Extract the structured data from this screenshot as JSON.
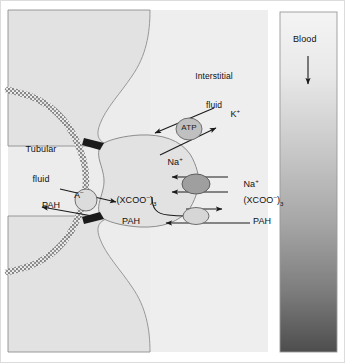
{
  "figure": {
    "background_color": "#ffffff",
    "border_color": "#d8d8d8",
    "width": 345,
    "height": 363
  },
  "compartments": {
    "tubular_fluid": {
      "label_line1": "Tubular",
      "label_line2": "fluid",
      "fill_color": "#ececec"
    },
    "interstitial_fluid": {
      "label_line1": "Interstitial",
      "label_line2": "fluid",
      "fill_color": "#eeeeee"
    },
    "blood": {
      "label": "Blood",
      "flow_arrow": "down-arrow-icon",
      "gradient_top_color": "#f2f2f2",
      "gradient_bottom_color": "#4f4f4f",
      "border_color": "#9a9a9a"
    },
    "cell": {
      "fill_color": "#e2e2e2",
      "outline_color": "#8c8c8c",
      "brush_border_color": "#8e8e8e",
      "tight_junction_color": "#1b1b1b"
    }
  },
  "transporters": {
    "apical_exchanger": {
      "name": "apical-anion-exchanger",
      "fill_color": "#dcdcdc",
      "stroke_color": "#6f6f6f"
    },
    "atp_pump": {
      "name": "sodium-potassium-atpase",
      "label": "ATP",
      "fill_color": "#c0c0c0",
      "stroke_color": "#6f6f6f"
    },
    "sodium_dicarboxylate": {
      "name": "sodium-dicarboxylate-cotransporter",
      "fill_color": "#9f9f9f",
      "stroke_color": "#5e5e5e"
    },
    "basolateral_exchanger": {
      "name": "basolateral-oat-exchanger",
      "fill_color": "#d6d6d6",
      "stroke_color": "#6f6f6f"
    }
  },
  "labels": {
    "potassium": "K",
    "potassium_charge": "+",
    "sodium_pump": "Na",
    "sodium_pump_charge": "+",
    "sodium_cotransport": "Na",
    "sodium_cotransport_charge": "+",
    "dicarboxylate_in_open": "(XCOO",
    "dicarboxylate_in_charge": "–",
    "dicarboxylate_in_close": ")",
    "dicarboxylate_in_sub": "3",
    "dicarboxylate_out_open": "(XCOO",
    "dicarboxylate_out_charge": "–",
    "dicarboxylate_out_close": ")",
    "dicarboxylate_out_sub": "3",
    "anion": "A",
    "anion_charge": "–",
    "pah_tubular": "PAH",
    "pah_cell": "PAH",
    "pah_blood": "PAH",
    "atp": "ATP"
  },
  "arrows": {
    "stroke_color": "#1a1a1a",
    "items": [
      {
        "name": "potassium-influx-arrow",
        "direction": "into-cell"
      },
      {
        "name": "sodium-efflux-arrow",
        "direction": "out-of-cell"
      },
      {
        "name": "sodium-cotransport-influx-arrow",
        "direction": "into-cell"
      },
      {
        "name": "dicarboxylate-influx-arrow",
        "direction": "into-cell"
      },
      {
        "name": "dicarboxylate-recycle-arrow",
        "direction": "curved-to-basolateral"
      },
      {
        "name": "dicarboxylate-efflux-arrow",
        "direction": "out-of-cell"
      },
      {
        "name": "pah-uptake-arrow",
        "direction": "into-cell"
      },
      {
        "name": "anion-efflux-arrow",
        "direction": "into-lumen"
      },
      {
        "name": "pah-secretion-arrow",
        "direction": "into-lumen"
      },
      {
        "name": "blood-flow-arrow",
        "direction": "down"
      }
    ]
  }
}
